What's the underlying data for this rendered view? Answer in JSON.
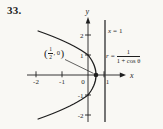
{
  "problem": {
    "number": "33."
  },
  "figure": {
    "equations": {
      "directrix": {
        "lhs": "x",
        "rel": "=",
        "rhs": "1"
      },
      "polar": {
        "lhs": "r",
        "rel": "=",
        "numerator": "1",
        "denominator": "1 + cos θ"
      }
    },
    "point_label": {
      "open": "(",
      "numerator": "1",
      "denominator": "2",
      "rest": ", 0",
      "close": ")"
    }
  },
  "chart_data": {
    "type": "line",
    "title": "",
    "xlabel": "x",
    "ylabel": "y",
    "xlim": [
      -2.6,
      1.6
    ],
    "ylim": [
      -2.7,
      2.9
    ],
    "x_ticks": [
      -2,
      -1,
      0,
      1
    ],
    "y_ticks": [
      -2,
      -1,
      1,
      2
    ],
    "grid": false,
    "legend": "none",
    "curves": [
      {
        "name": "r = 1/(1 + cos θ)",
        "kind": "parabola",
        "cartesian": "x = 0.5 - 0.5*y^2",
        "a": 0.5,
        "b": -0.5,
        "y_range": [
          -2.2,
          2.2
        ],
        "sample_points": [
          [
            -1.5,
            -2
          ],
          [
            0,
            -1
          ],
          [
            0.5,
            0
          ],
          [
            0,
            1
          ],
          [
            -1.5,
            2
          ]
        ]
      },
      {
        "name": "x = 1",
        "kind": "vertical-line",
        "x": 1
      }
    ],
    "marked_point": {
      "x": 0.5,
      "y": 0,
      "label": "(1/2, 0)"
    }
  },
  "colors": {
    "ink": "#1f1f1f",
    "directrix": "#3d3d3d",
    "background": "#f9f8f4"
  }
}
